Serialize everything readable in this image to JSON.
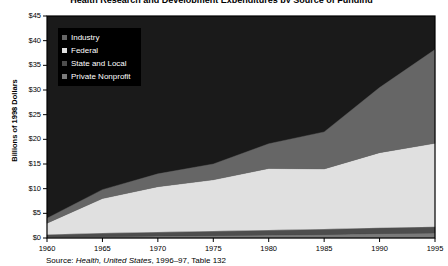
{
  "chart_data": {
    "type": "area",
    "stacked": true,
    "title": "Health Research and Development Expenditures by Source of Funding",
    "xlabel": "",
    "ylabel": "Billions of 1998 Dollars",
    "ylim": [
      0,
      45
    ],
    "xlim": [
      1960,
      1995
    ],
    "ytick_labels": [
      "$0",
      "$5",
      "$10",
      "$15",
      "$20",
      "$25",
      "$30",
      "$35",
      "$40",
      "$45"
    ],
    "ytick_values": [
      0,
      5,
      10,
      15,
      20,
      25,
      30,
      35,
      40,
      45
    ],
    "xtick_labels": [
      "1960",
      "1965",
      "1970",
      "1975",
      "1980",
      "1985",
      "1990",
      "1995"
    ],
    "xtick_values": [
      1960,
      1965,
      1970,
      1975,
      1980,
      1985,
      1990,
      1995
    ],
    "grid": false,
    "legend_position": "upper-left",
    "x": [
      1960,
      1965,
      1970,
      1975,
      1980,
      1985,
      1990,
      1995
    ],
    "series": [
      {
        "name": "Private Nonprofit",
        "color": "#7a7a7a",
        "values": [
          0.2,
          0.3,
          0.4,
          0.5,
          0.6,
          0.7,
          0.9,
          1.0
        ]
      },
      {
        "name": "State and Local",
        "color": "#4d4d4d",
        "values": [
          0.5,
          0.7,
          0.8,
          0.9,
          1.0,
          1.1,
          1.2,
          1.3
        ]
      },
      {
        "name": "Federal",
        "color": "#e0e0e0",
        "values": [
          2.3,
          7.0,
          9.2,
          10.4,
          12.5,
          12.2,
          15.2,
          16.9
        ]
      },
      {
        "name": "Industry",
        "color": "#666666",
        "values": [
          1.0,
          1.8,
          2.6,
          3.2,
          5.0,
          7.5,
          13.2,
          19.0
        ]
      }
    ],
    "totals": [
      4.0,
      9.8,
      13.0,
      15.0,
      19.1,
      21.5,
      30.5,
      38.2
    ]
  },
  "source": {
    "prefix": "Source: ",
    "italic_part": "Health, United States",
    "suffix": ", 1996–97, Table 132"
  },
  "legend": {
    "items": [
      {
        "label": "Industry",
        "color": "#666666"
      },
      {
        "label": "Federal",
        "color": "#e0e0e0"
      },
      {
        "label": "State and Local",
        "color": "#4d4d4d"
      },
      {
        "label": "Private Nonprofit",
        "color": "#7a7a7a"
      }
    ]
  },
  "colors": {
    "plot_background": "#1a1a1a",
    "frame": "#000000",
    "page_background": "#ffffff",
    "text": "#000000"
  }
}
